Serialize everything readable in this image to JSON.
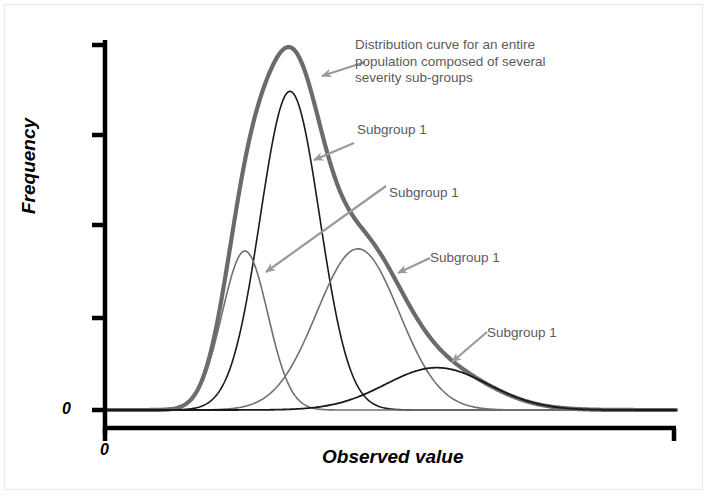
{
  "figure": {
    "background_color": "#ffffff",
    "border_color": "#e9e9e9"
  },
  "axes": {
    "y_title": "Frequency",
    "x_title": "Observed value",
    "y_zero_label": "0",
    "x_zero_label": "0",
    "axis_color": "#000000"
  },
  "annotations": {
    "main_curve": "Distribution curve for an entire population composed of several severity sub-groups",
    "subgroup_1": "Subgroup 1",
    "subgroup_2": "Subgroup 1",
    "subgroup_3": "Subgroup 1",
    "subgroup_4": "Subgroup 1"
  },
  "colors": {
    "envelope": "#6b6b6b",
    "subgroup_dark": "#1a1a1a",
    "subgroup_gray": "#707070",
    "arrow": "#9a9a9a",
    "text": "#5b5b5b"
  },
  "chart_data": {
    "type": "line",
    "title": "",
    "xlabel": "Observed value",
    "ylabel": "Frequency",
    "xlim": [
      0,
      1
    ],
    "ylim": [
      0,
      1
    ],
    "grid": false,
    "legend_position": "none",
    "axis_pixels": {
      "x_origin": 105,
      "x_end": 676,
      "y_baseline": 410,
      "y_top": 42
    },
    "y_ticks_pixel": [
      45,
      135,
      225,
      318,
      410
    ],
    "series": [
      {
        "name": "Envelope (whole population)",
        "role": "envelope",
        "color": "#6b6b6b",
        "stroke_width": 4.2,
        "peak_x_pixel": 283,
        "peak_y_pixel": 47,
        "amplitude_rel": 1.0,
        "mean_rel": 0.312,
        "sigma_rel": 0.088
      },
      {
        "name": "Subgroup 1",
        "role": "component",
        "color": "#1a1a1a",
        "stroke_width": 1.6,
        "peak_x_pixel": 290,
        "peak_y_pixel": 92,
        "amplitude_rel": 0.866,
        "mean_rel": 0.324,
        "sigma_rel": 0.052
      },
      {
        "name": "Subgroup 1",
        "role": "component",
        "color": "#707070",
        "stroke_width": 1.6,
        "peak_x_pixel": 245,
        "peak_y_pixel": 252,
        "amplitude_rel": 0.432,
        "mean_rel": 0.245,
        "sigma_rel": 0.04
      },
      {
        "name": "Subgroup 1",
        "role": "component",
        "color": "#707070",
        "stroke_width": 1.6,
        "peak_x_pixel": 358,
        "peak_y_pixel": 250,
        "amplitude_rel": 0.438,
        "mean_rel": 0.443,
        "sigma_rel": 0.072
      },
      {
        "name": "Subgroup 1",
        "role": "component",
        "color": "#1a1a1a",
        "stroke_width": 1.8,
        "peak_x_pixel": 437,
        "peak_y_pixel": 368,
        "amplitude_rel": 0.115,
        "mean_rel": 0.581,
        "sigma_rel": 0.09
      }
    ],
    "arrows": [
      {
        "name": "arrow-main",
        "from": [
          365,
          62
        ],
        "to": [
          322,
          76
        ]
      },
      {
        "name": "arrow-sub1",
        "from": [
          354,
          143
        ],
        "to": [
          314,
          160
        ]
      },
      {
        "name": "arrow-sub2",
        "from": [
          386,
          186
        ],
        "to": [
          266,
          272
        ]
      },
      {
        "name": "arrow-sub3",
        "from": [
          430,
          258
        ],
        "to": [
          398,
          273
        ]
      },
      {
        "name": "arrow-sub4",
        "from": [
          487,
          332
        ],
        "to": [
          452,
          362
        ]
      }
    ]
  }
}
